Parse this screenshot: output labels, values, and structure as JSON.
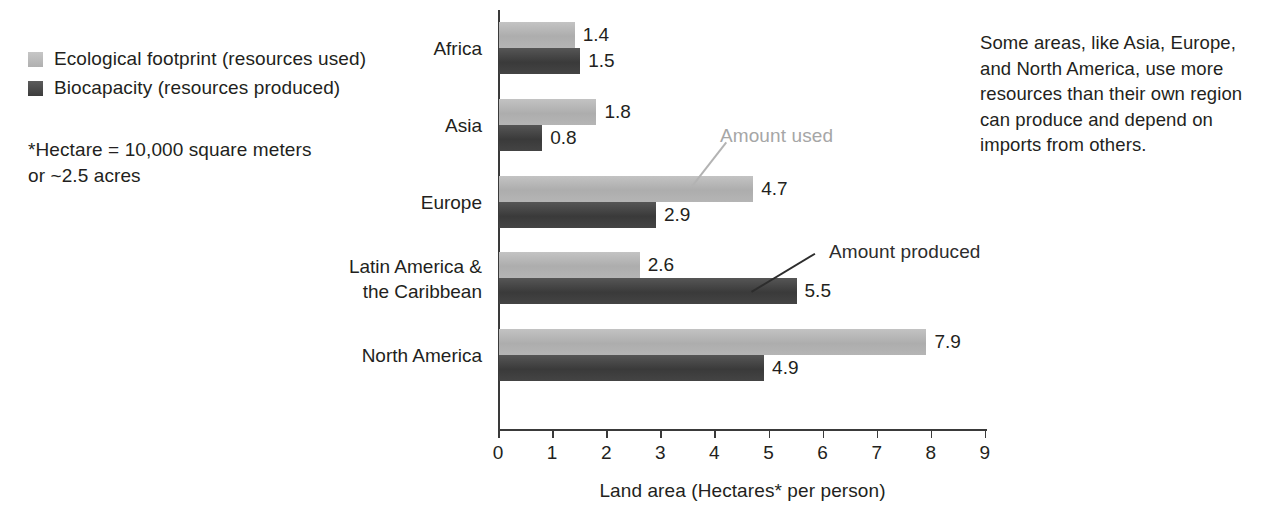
{
  "chart_data": {
    "type": "bar",
    "orientation": "horizontal",
    "title": "",
    "xlabel": "Land area (Hectares* per person)",
    "ylabel": "",
    "xlim": [
      0,
      9
    ],
    "xticks": [
      "0",
      "1",
      "2",
      "3",
      "4",
      "5",
      "6",
      "7",
      "8",
      "9"
    ],
    "grid": false,
    "legend_position": "top-left",
    "categories": [
      "Africa",
      "Asia",
      "Europe",
      "Latin America &\nthe Caribbean",
      "North America"
    ],
    "category_lines": [
      [
        "Africa"
      ],
      [
        "Asia"
      ],
      [
        "Europe"
      ],
      [
        "Latin America &",
        "the Caribbean"
      ],
      [
        "North America"
      ]
    ],
    "series": [
      {
        "name": "Ecological footprint (resources used)",
        "color": "#b4b4b4",
        "values": [
          1.4,
          1.8,
          4.7,
          2.6,
          7.9
        ],
        "value_labels": [
          "1.4",
          "1.8",
          "4.7",
          "2.6",
          "7.9"
        ]
      },
      {
        "name": "Biocapacity (resources produced)",
        "color": "#3f3f3f",
        "values": [
          1.5,
          0.8,
          2.9,
          5.5,
          4.9
        ],
        "value_labels": [
          "1.5",
          "0.8",
          "2.9",
          "5.5",
          "4.9"
        ]
      }
    ],
    "annotations": [
      {
        "text": "Amount used",
        "color": "#a6a6a6",
        "points_to": "Europe ecological footprint bar"
      },
      {
        "text": "Amount produced",
        "color": "#2d2d2d",
        "points_to": "Latin America & the Caribbean biocapacity bar"
      }
    ]
  },
  "legend": {
    "items": [
      {
        "label": "Ecological footprint (resources used)",
        "swatch": "light"
      },
      {
        "label": "Biocapacity (resources produced)",
        "swatch": "dark"
      }
    ]
  },
  "footnote": {
    "lines": [
      "*Hectare = 10,000 square meters",
      "or ~2.5 acres"
    ]
  },
  "side_note": {
    "lines": [
      "Some areas, like Asia, Europe,",
      "and North America, use more",
      "resources than their own region",
      "can produce and depend on",
      "imports from others."
    ]
  },
  "colors": {
    "light_bar": "#b4b4b4",
    "dark_bar": "#3f3f3f",
    "axis": "#3a3a3a",
    "text": "#231f20",
    "annotation_used": "#a6a6a6",
    "annotation_produced": "#2d2d2d"
  }
}
